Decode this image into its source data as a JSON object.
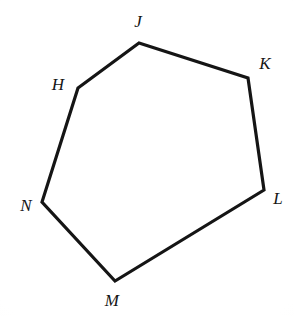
{
  "figure": {
    "kind": "geometry-diagram",
    "shape_name": "hexagon",
    "stroke_color": "#151515",
    "background_color": "#fefefe",
    "stroke_width": 3.2,
    "canvas": {
      "width": 294,
      "height": 316
    },
    "vertices": [
      {
        "label": "H",
        "x": 78,
        "y": 88,
        "label_x": 58,
        "label_y": 84
      },
      {
        "label": "J",
        "x": 139,
        "y": 43,
        "label_x": 138,
        "label_y": 21
      },
      {
        "label": "K",
        "x": 248,
        "y": 78,
        "label_x": 265,
        "label_y": 63
      },
      {
        "label": "L",
        "x": 264,
        "y": 190,
        "label_x": 278,
        "label_y": 198
      },
      {
        "label": "M",
        "x": 115,
        "y": 281,
        "label_x": 112,
        "label_y": 300
      },
      {
        "label": "N",
        "x": 42,
        "y": 202,
        "label_x": 26,
        "label_y": 205
      }
    ],
    "edges": [
      {
        "from": "H",
        "to": "J"
      },
      {
        "from": "J",
        "to": "K"
      },
      {
        "from": "K",
        "to": "L"
      },
      {
        "from": "L",
        "to": "M"
      },
      {
        "from": "M",
        "to": "N"
      },
      {
        "from": "N",
        "to": "H"
      }
    ]
  }
}
